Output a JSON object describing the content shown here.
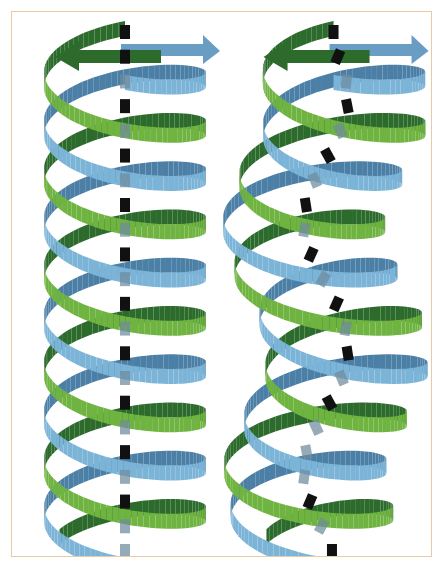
{
  "figure": {
    "background_color": "#ffffff",
    "frame": {
      "border_color": "#e9caa6",
      "fill_color": "#ffffff",
      "x": 11,
      "y": 11,
      "width": 421,
      "height": 546,
      "border_width": 1.5
    }
  },
  "palette": {
    "blue_front": "#7cb4d8",
    "blue_back": "#4b7fa6",
    "green_front": "#6fb340",
    "green_back": "#2c6b2c",
    "axis_dash_visible": "#111111",
    "axis_dash_occluded": "#6d8a9c",
    "arrow_green": "#2c6b2c",
    "arrow_blue": "#6a9dc4"
  },
  "panels": [
    {
      "id": "left-helix",
      "name": "straight-double-helix",
      "label": "straight coiled-coil",
      "center_x": 125,
      "top_y": 48,
      "bottom_y": 545,
      "radius_x": 81,
      "radius_y": 27,
      "turns": 5.15,
      "axis_type": "straight",
      "axis_amplitude": 0,
      "ribbon_width": 15,
      "strand_count": 2,
      "strand_phase_offset_deg": 180,
      "arrowheads": [
        {
          "name": "green-arrowhead",
          "direction": "left",
          "color": "#2c6b2c"
        },
        {
          "name": "blue-arrowhead",
          "direction": "right",
          "color": "#6a9dc4"
        }
      ],
      "dash_count": 22
    },
    {
      "id": "right-helix",
      "name": "supercoiled-double-helix",
      "label": "supercoiled coiled-coil",
      "center_x": 326,
      "top_y": 48,
      "bottom_y": 545,
      "radius_x": 81,
      "radius_y": 27,
      "turns": 5.15,
      "axis_type": "wavy",
      "axis_amplitude": 22,
      "axis_wavelength": 250,
      "ribbon_width": 15,
      "strand_count": 2,
      "strand_phase_offset_deg": 180,
      "arrowheads": [
        {
          "name": "green-arrowhead",
          "direction": "left",
          "color": "#2c6b2c"
        },
        {
          "name": "blue-arrowhead",
          "direction": "right",
          "color": "#6a9dc4"
        }
      ],
      "dash_count": 22
    }
  ],
  "chart_data": {
    "type": "diagram",
    "series": [
      {
        "name": "blue ribbon",
        "color": "#7cb4d8",
        "role": "strand-1"
      },
      {
        "name": "green ribbon",
        "color": "#6fb340",
        "role": "strand-2"
      },
      {
        "name": "helix axis",
        "color": "#111111",
        "role": "dashed-axis"
      }
    ]
  }
}
